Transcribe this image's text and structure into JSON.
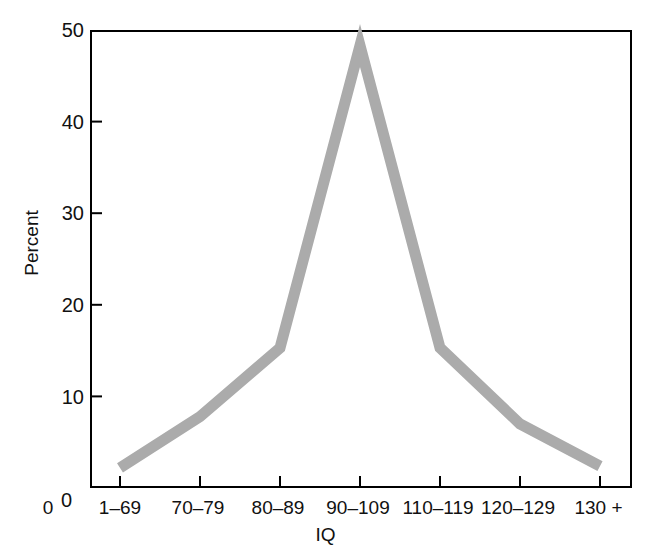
{
  "chart_data": {
    "type": "line",
    "title": "",
    "subtitle": "",
    "xlabel": "IQ",
    "ylabel": "Percent",
    "categories": [
      "1–69",
      "70–79",
      "80–89",
      "90–109",
      "110–119",
      "120–129",
      "130 +"
    ],
    "values": [
      2.2,
      7.8,
      15.3,
      48.3,
      15.3,
      7.0,
      2.4
    ],
    "x_tick_labels": [
      "1–69",
      "70–79",
      "80–89",
      "90–109",
      "110–119",
      "120–129",
      "130 +"
    ],
    "y_tick_labels": [
      "0",
      "10",
      "20",
      "30",
      "40",
      "50"
    ],
    "y_ticks": [
      0,
      10,
      20,
      30,
      40,
      50
    ],
    "ylim": [
      0,
      50
    ],
    "xlim_note": "categorical, 7 positions",
    "grid": false,
    "legend": false,
    "legend_position": "none",
    "series": [
      {
        "name": "Percent",
        "values": [
          2.2,
          7.8,
          15.3,
          48.3,
          15.3,
          7.0,
          2.4
        ],
        "color": "#ababab",
        "line_width_px": 11
      }
    ],
    "origin_label": "0",
    "annotations": []
  },
  "axes": {
    "y_axis_name": "Percent",
    "x_axis_name": "IQ",
    "origin_tick_label": "0"
  },
  "colors": {
    "line": "#ababab",
    "frame": "#000000",
    "text": "#111111",
    "background": "#ffffff"
  }
}
